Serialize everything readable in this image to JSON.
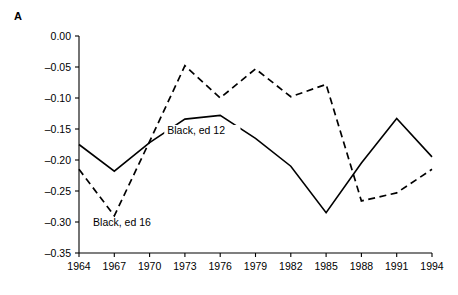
{
  "panel": {
    "letter": "A"
  },
  "chart_data": {
    "type": "line",
    "title": "",
    "subtitle": "",
    "xlabel": "",
    "ylabel": "",
    "grid": false,
    "legend_position": "inline-annotations",
    "x": [
      1964,
      1967,
      1970,
      1973,
      1976,
      1979,
      1982,
      1985,
      1988,
      1991,
      1994
    ],
    "xticklabels": [
      "1964",
      "1967",
      "1970",
      "1973",
      "1976",
      "1979",
      "1982",
      "1985",
      "1988",
      "1991",
      "1994"
    ],
    "xlim": [
      1964,
      1994
    ],
    "yticks": [
      0.0,
      -0.05,
      -0.1,
      -0.15,
      -0.2,
      -0.25,
      -0.3,
      -0.35
    ],
    "yticklabels": [
      "0.00",
      "–0.05",
      "–0.10",
      "–0.15",
      "–0.20",
      "–0.25",
      "–0.30",
      "–0.35"
    ],
    "ylim": [
      -0.35,
      0.0
    ],
    "series": [
      {
        "name": "Black, ed 12",
        "style": "solid",
        "color": "#000000",
        "label_x": 1971.5,
        "label_y": -0.158,
        "values": [
          -0.175,
          -0.218,
          -0.172,
          -0.134,
          -0.128,
          -0.165,
          -0.21,
          -0.285,
          -0.205,
          -0.133,
          -0.195
        ]
      },
      {
        "name": "Black, ed 16",
        "style": "dashed",
        "color": "#000000",
        "label_x": 1965.2,
        "label_y": -0.307,
        "values": [
          -0.215,
          -0.29,
          -0.17,
          -0.048,
          -0.1,
          -0.053,
          -0.098,
          -0.078,
          -0.266,
          -0.253,
          -0.215
        ]
      }
    ]
  }
}
